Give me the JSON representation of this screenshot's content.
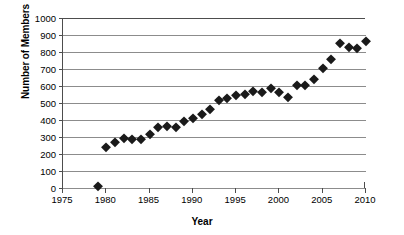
{
  "chart_data": {
    "type": "scatter",
    "title": "",
    "xlabel": "Year",
    "ylabel": "Number of Members",
    "xlim": [
      1975,
      2010
    ],
    "ylim": [
      0,
      1000
    ],
    "xticks": [
      1975,
      1980,
      1985,
      1990,
      1995,
      2000,
      2005,
      2010
    ],
    "yticks": [
      0,
      100,
      200,
      300,
      400,
      500,
      600,
      700,
      800,
      900,
      1000
    ],
    "grid": "horizontal",
    "legend": "none",
    "marker": "filled-diamond",
    "marker_color": "#1a1a1a",
    "x": [
      1979,
      1980,
      1981,
      1982,
      1983,
      1984,
      1985,
      1986,
      1987,
      1988,
      1989,
      1990,
      1991,
      1992,
      1993,
      1994,
      1995,
      1996,
      1997,
      1998,
      1999,
      2000,
      2001,
      2002,
      2003,
      2004,
      2005,
      2006,
      2007,
      2008,
      2009,
      2010
    ],
    "values": [
      10,
      240,
      270,
      293,
      290,
      288,
      320,
      358,
      362,
      360,
      395,
      410,
      433,
      462,
      520,
      528,
      548,
      555,
      568,
      567,
      587,
      567,
      535,
      605,
      608,
      640,
      707,
      757,
      853,
      832,
      823,
      863
    ]
  }
}
